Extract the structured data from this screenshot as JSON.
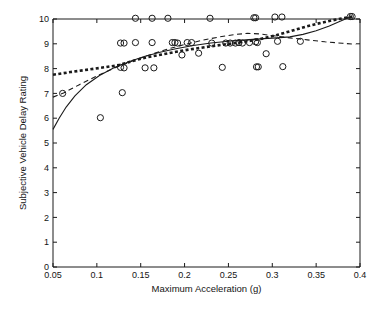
{
  "chart_data": {
    "type": "scatter",
    "title": "",
    "xlabel": "Maximum Acceleration (g)",
    "ylabel": "Subjective Vehicle Delay Rating",
    "xlim": [
      0.05,
      0.4
    ],
    "ylim": [
      0,
      10
    ],
    "xticks": [
      0.05,
      0.1,
      0.15,
      0.2,
      0.25,
      0.3,
      0.35,
      0.4
    ],
    "xticklabels": [
      "0.05",
      "0.1",
      "0.15",
      "0.2",
      "0.25",
      "0.3",
      "0.35",
      "0.4"
    ],
    "yticks": [
      0,
      1,
      2,
      3,
      4,
      5,
      6,
      7,
      8,
      9,
      10
    ],
    "yticklabels": [
      "0",
      "1",
      "2",
      "3",
      "4",
      "5",
      "6",
      "7",
      "8",
      "9",
      "10"
    ],
    "grid": false,
    "legend": "none",
    "marker_style": "open-circle",
    "series": [
      {
        "name": "Observed ratings",
        "type": "scatter",
        "marker": "open-circle",
        "points": [
          [
            0.061,
            7.0
          ],
          [
            0.104,
            6.02
          ],
          [
            0.127,
            9.03
          ],
          [
            0.131,
            9.03
          ],
          [
            0.129,
            7.03
          ],
          [
            0.127,
            8.05
          ],
          [
            0.131,
            8.03
          ],
          [
            0.144,
            10.03
          ],
          [
            0.144,
            9.05
          ],
          [
            0.155,
            8.03
          ],
          [
            0.163,
            10.03
          ],
          [
            0.163,
            9.05
          ],
          [
            0.165,
            8.03
          ],
          [
            0.181,
            10.03
          ],
          [
            0.186,
            9.05
          ],
          [
            0.189,
            9.05
          ],
          [
            0.192,
            9.03
          ],
          [
            0.197,
            8.55
          ],
          [
            0.203,
            9.05
          ],
          [
            0.208,
            9.05
          ],
          [
            0.216,
            8.62
          ],
          [
            0.229,
            10.03
          ],
          [
            0.231,
            9.03
          ],
          [
            0.243,
            8.05
          ],
          [
            0.247,
            9.03
          ],
          [
            0.252,
            9.03
          ],
          [
            0.258,
            9.03
          ],
          [
            0.262,
            9.05
          ],
          [
            0.266,
            9.03
          ],
          [
            0.274,
            9.05
          ],
          [
            0.279,
            10.05
          ],
          [
            0.281,
            10.05
          ],
          [
            0.281,
            9.08
          ],
          [
            0.283,
            9.05
          ],
          [
            0.282,
            8.07
          ],
          [
            0.284,
            8.07
          ],
          [
            0.293,
            8.6
          ],
          [
            0.303,
            10.08
          ],
          [
            0.306,
            9.1
          ],
          [
            0.311,
            10.08
          ],
          [
            0.312,
            8.08
          ],
          [
            0.332,
            9.1
          ],
          [
            0.389,
            10.1
          ],
          [
            0.391,
            10.1
          ]
        ]
      },
      {
        "name": "Fit curve 1 (solid)",
        "type": "line",
        "style": "solid",
        "points": [
          [
            0.05,
            5.55
          ],
          [
            0.057,
            6.0
          ],
          [
            0.065,
            6.45
          ],
          [
            0.075,
            6.9
          ],
          [
            0.088,
            7.35
          ],
          [
            0.103,
            7.72
          ],
          [
            0.12,
            8.04
          ],
          [
            0.138,
            8.3
          ],
          [
            0.155,
            8.5
          ],
          [
            0.172,
            8.66
          ],
          [
            0.19,
            8.8
          ],
          [
            0.21,
            8.93
          ],
          [
            0.23,
            9.03
          ],
          [
            0.25,
            9.1
          ],
          [
            0.27,
            9.16
          ],
          [
            0.29,
            9.21
          ],
          [
            0.305,
            9.24
          ],
          [
            0.32,
            9.28
          ],
          [
            0.335,
            9.38
          ],
          [
            0.35,
            9.53
          ],
          [
            0.365,
            9.72
          ],
          [
            0.378,
            9.92
          ],
          [
            0.39,
            10.1
          ]
        ]
      },
      {
        "name": "Fit curve 2 (dashed)",
        "type": "line",
        "style": "dashed",
        "points": [
          [
            0.05,
            6.85
          ],
          [
            0.062,
            7.02
          ],
          [
            0.08,
            7.35
          ],
          [
            0.1,
            7.7
          ],
          [
            0.12,
            8.02
          ],
          [
            0.14,
            8.3
          ],
          [
            0.16,
            8.55
          ],
          [
            0.18,
            8.78
          ],
          [
            0.2,
            8.97
          ],
          [
            0.22,
            9.14
          ],
          [
            0.24,
            9.28
          ],
          [
            0.258,
            9.38
          ],
          [
            0.272,
            9.42
          ],
          [
            0.285,
            9.4
          ],
          [
            0.3,
            9.33
          ],
          [
            0.32,
            9.24
          ],
          [
            0.34,
            9.16
          ],
          [
            0.36,
            9.08
          ],
          [
            0.38,
            9.02
          ],
          [
            0.395,
            8.98
          ]
        ]
      },
      {
        "name": "Fit curve 3 (thick dotted)",
        "type": "line",
        "style": "dotted",
        "points": [
          [
            0.05,
            7.75
          ],
          [
            0.07,
            7.86
          ],
          [
            0.09,
            7.96
          ],
          [
            0.11,
            8.06
          ],
          [
            0.125,
            8.14
          ],
          [
            0.14,
            8.3
          ],
          [
            0.155,
            8.44
          ],
          [
            0.17,
            8.54
          ],
          [
            0.185,
            8.64
          ],
          [
            0.2,
            8.74
          ],
          [
            0.215,
            8.82
          ],
          [
            0.23,
            8.9
          ],
          [
            0.245,
            8.97
          ],
          [
            0.26,
            9.04
          ],
          [
            0.275,
            9.12
          ],
          [
            0.29,
            9.22
          ],
          [
            0.305,
            9.35
          ],
          [
            0.32,
            9.5
          ],
          [
            0.335,
            9.66
          ],
          [
            0.35,
            9.8
          ],
          [
            0.365,
            9.92
          ],
          [
            0.38,
            10.03
          ],
          [
            0.392,
            10.1
          ]
        ]
      }
    ]
  },
  "colors": {
    "ink": "#1a1a1a",
    "background": "#ffffff"
  }
}
